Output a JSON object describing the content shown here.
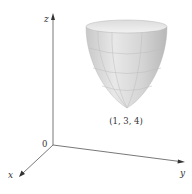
{
  "figure": {
    "axes": {
      "z_label": "z",
      "y_label": "y",
      "x_label": "x",
      "origin_label": "0"
    },
    "surface": {
      "type": "elliptic paraboloid",
      "vertex_label": "(1, 3, 4)"
    },
    "colors": {
      "axis": "#555555",
      "surface_light": "#e6e6e6",
      "surface_mid": "#cfcfcf",
      "surface_dark": "#a9a9a9",
      "grid_line": "#bdbdbd",
      "text": "#333333"
    }
  }
}
